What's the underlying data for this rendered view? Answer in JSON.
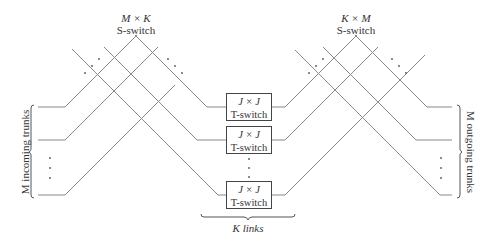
{
  "left_sswitch": {
    "dims": "M × K",
    "label": "S-switch"
  },
  "right_sswitch": {
    "dims": "K × M",
    "label": "S-switch"
  },
  "tswitches": [
    {
      "dims": "J × J",
      "label": "T-switch"
    },
    {
      "dims": "J × J",
      "label": "T-switch"
    },
    {
      "dims": "J × J",
      "label": "T-switch"
    }
  ],
  "incoming_label": "M incoming trunks",
  "outgoing_label": "M outgoing trunks",
  "links_label": "K links",
  "colors": {
    "line": "#777777",
    "text": "#333333",
    "box_border": "#444444"
  }
}
